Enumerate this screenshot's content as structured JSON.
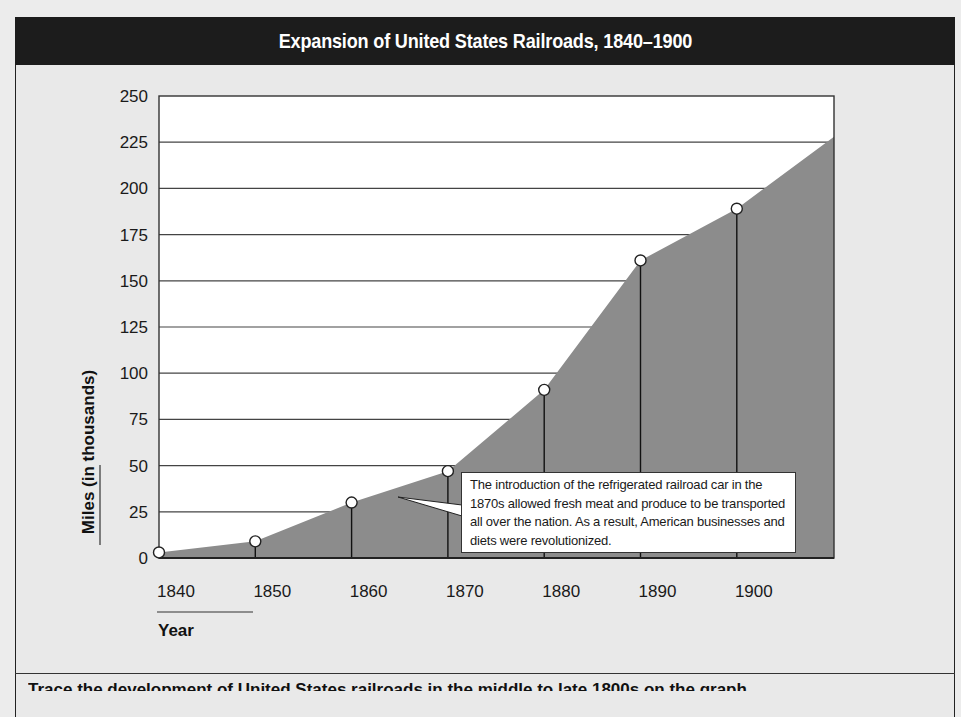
{
  "title": "Expansion of United States Railroads, 1840–1900",
  "callout": {
    "text": "The introduction of the refrigerated railroad car in the 1870s allowed fresh meat and produce to be transported all over the nation. As a result, American businesses and diets were revolutionized."
  },
  "bottom_text": "Trace the development of United States railroads in the middle to late 1800s on the graph.",
  "colors": {
    "header_bg": "#1c1c1c",
    "area_fill": "#8c8c8c",
    "plot_bg": "#ffffff",
    "page_bg": "#ececec"
  },
  "chart_data": {
    "type": "area",
    "title": "Expansion of United States Railroads, 1840–1900",
    "xlabel": "Year",
    "ylabel": "Miles (in thousands)",
    "categories": [
      "1840",
      "1850",
      "1860",
      "1870",
      "1880",
      "1890",
      "1900"
    ],
    "x": [
      1840,
      1850,
      1860,
      1870,
      1880,
      1890,
      1900
    ],
    "values": [
      3,
      9,
      30,
      47,
      91,
      161,
      189
    ],
    "series": [
      {
        "name": "Railroad miles (thousands)",
        "values": [
          3,
          9,
          30,
          47,
          91,
          161,
          189
        ]
      }
    ],
    "area_end": {
      "x": 1910,
      "y": 228
    },
    "ylim": [
      0,
      250
    ],
    "yticks": [
      0,
      25,
      50,
      75,
      100,
      125,
      150,
      175,
      200,
      225,
      250
    ],
    "grid": true,
    "legend": "none",
    "markers": "open circles on drop lines",
    "annotations": [
      {
        "target_year": 1865,
        "text": "The introduction of the refrigerated railroad car in the 1870s allowed fresh meat and produce to be transported all over the nation. As a result, American businesses and diets were revolutionized."
      }
    ]
  }
}
